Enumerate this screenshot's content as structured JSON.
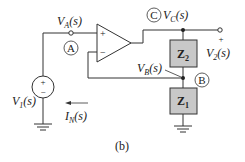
{
  "figure": {
    "caption": "(b)",
    "colors": {
      "wire": "#333333",
      "impedance_fill": "#c8c8c8",
      "impedance_stroke": "#333333",
      "background": "#ffffff"
    }
  },
  "nodes": {
    "A": {
      "marker": "A",
      "voltage_label_main": "V",
      "voltage_label_sub": "A",
      "voltage_label_tail": "(s)"
    },
    "B": {
      "marker": "B",
      "voltage_label_main": "V",
      "voltage_label_sub": "B",
      "voltage_label_tail": "(s)"
    },
    "C": {
      "marker": "C",
      "voltage_label_main": "V",
      "voltage_label_sub": "C",
      "voltage_label_tail": "(s)"
    }
  },
  "op_amp": {
    "plus_label": "+",
    "minus_label": "−"
  },
  "source": {
    "plus": "+",
    "minus": "−",
    "label_main": "V",
    "label_sub": "1",
    "label_tail": "(s)"
  },
  "output": {
    "plus": "+",
    "label_main": "V",
    "label_sub": "2",
    "label_tail": "(s)"
  },
  "impedances": {
    "z2": {
      "main": "Z",
      "sub": "2"
    },
    "z1": {
      "main": "Z",
      "sub": "1"
    }
  },
  "current": {
    "label_main": "I",
    "label_sub": "N",
    "label_tail": "(s)",
    "direction": "left"
  }
}
